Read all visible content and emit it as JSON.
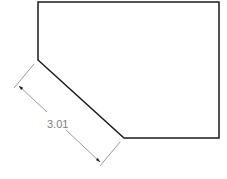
{
  "diagram": {
    "type": "cad-drawing",
    "shape": {
      "description": "pentagon with chamfered lower-left corner",
      "stroke_color": "#1a1a1a"
    },
    "dimension": {
      "label": "3.01",
      "color": "#808080",
      "measures": "chamfer edge length"
    }
  }
}
